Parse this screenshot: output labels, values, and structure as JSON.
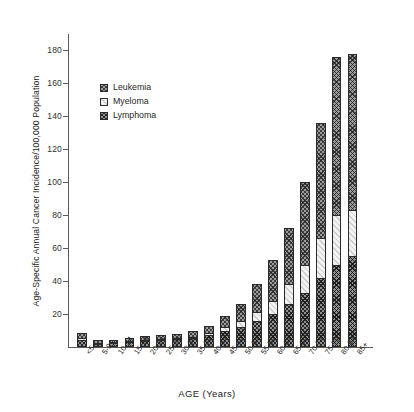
{
  "chart_data": {
    "type": "bar",
    "subtype": "stacked-bar",
    "title": "",
    "xlabel": "AGE (Years)",
    "ylabel": "Age-Specific Annual Cancer Incidence/100,000 Population",
    "ylim": [
      0,
      190
    ],
    "yticks": [
      20,
      40,
      60,
      80,
      100,
      120,
      140,
      160,
      180
    ],
    "ytick_labels": [
      "20",
      "40",
      "60",
      "80",
      "100",
      "120",
      "140",
      "160",
      "180"
    ],
    "grid": false,
    "legend_position": "upper-left-inside",
    "categories": [
      "<5",
      "5-9",
      "10-14",
      "15-19",
      "20-24",
      "25-29",
      "30-34",
      "35-39",
      "40-44",
      "45-49",
      "50-54",
      "55-59",
      "60-64",
      "65-69",
      "70-74",
      "75-79",
      "80-84",
      "85+"
    ],
    "series": [
      {
        "name": "Lymphoma",
        "stack_order": 0,
        "values": [
          4.5,
          2.0,
          2.2,
          3.0,
          3.6,
          4.2,
          4.6,
          5.2,
          7.0,
          9.5,
          12.0,
          15.5,
          20.0,
          26.0,
          33.0,
          42.0,
          50.0,
          55.0
        ]
      },
      {
        "name": "Myeloma",
        "stack_order": 1,
        "values": [
          0.3,
          0.3,
          0.3,
          0.4,
          0.5,
          0.6,
          0.8,
          1.0,
          1.5,
          2.5,
          3.5,
          5.5,
          8.0,
          12.0,
          17.0,
          24.0,
          30.0,
          28.0
        ]
      },
      {
        "name": "Leukemia",
        "stack_order": 2,
        "values": [
          3.4,
          1.5,
          1.3,
          1.6,
          2.1,
          2.4,
          2.8,
          3.4,
          4.5,
          7.0,
          10.5,
          17.0,
          25.0,
          34.0,
          50.0,
          70.0,
          96.0,
          95.0
        ]
      }
    ],
    "totals": [
      8.2,
      3.8,
      3.8,
      5.0,
      6.2,
      7.2,
      8.2,
      9.6,
      13.0,
      19.0,
      26.0,
      38.0,
      53.0,
      72.0,
      100.0,
      136.0,
      176.0,
      178.0
    ]
  },
  "axes": {
    "y_title": "Age-Specific Annual Cancer Incidence/100,000 Population",
    "x_title": "AGE (Years)"
  },
  "legend": {
    "items": [
      {
        "label": "Leukemia",
        "key": "leukemia"
      },
      {
        "label": "Myeloma",
        "key": "myeloma"
      },
      {
        "label": "Lymphoma",
        "key": "lymphoma"
      }
    ]
  },
  "colors": {
    "lymphoma": "#8f8f8f",
    "myeloma": "#f2f2f2",
    "leukemia": "#9a9a9a",
    "axis": "#5a5a5a",
    "text": "#242424"
  }
}
